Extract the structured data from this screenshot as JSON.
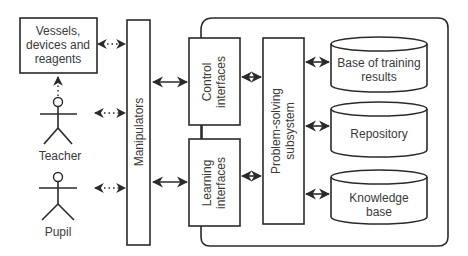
{
  "diagram": {
    "external": {
      "vessels": {
        "lines": [
          "Vessels,",
          "devices and",
          "reagents"
        ]
      },
      "teacher": {
        "label": "Teacher"
      },
      "pupil": {
        "label": "Pupil"
      }
    },
    "manipulators": {
      "label": "Manipulators"
    },
    "interfaces": {
      "control": {
        "lines": [
          "Control",
          "interfaces"
        ]
      },
      "learning": {
        "lines": [
          "Learning",
          "interfaces"
        ]
      }
    },
    "problem_solving": {
      "lines": [
        "Problem-solving",
        "subsystem"
      ]
    },
    "databases": [
      {
        "lines": [
          "Base of training",
          "results"
        ]
      },
      {
        "lines": [
          "Repository"
        ]
      },
      {
        "lines": [
          "Knowledge",
          "base"
        ]
      }
    ],
    "colors": {
      "stroke": "#2a2a2a",
      "text": "#3a3a3a",
      "background": "#ffffff"
    }
  }
}
